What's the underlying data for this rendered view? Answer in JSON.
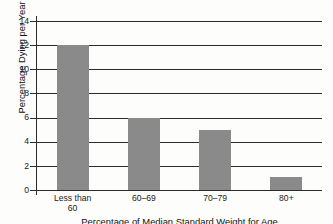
{
  "chart_data": {
    "type": "bar",
    "title": "",
    "xlabel": "Percentage of Median Standard Weight for Age",
    "ylabel": "Percentage Dying per Year",
    "categories": [
      "Less than 60",
      "60–69",
      "70–79",
      "80+"
    ],
    "category_lines": [
      [
        "Less than",
        "60"
      ],
      [
        "60–69"
      ],
      [
        "70–79"
      ],
      [
        "80+"
      ]
    ],
    "values": [
      12,
      6,
      5,
      1.1
    ],
    "ylim": [
      0,
      14
    ],
    "yticks": [
      0,
      2,
      4,
      6,
      8,
      10,
      12,
      14
    ],
    "ytick_labels": [
      "0",
      "2",
      "4",
      "6",
      "8",
      "10",
      "12",
      "14"
    ],
    "grid": "horizontal",
    "legend": "none",
    "series": [
      {
        "name": "Percentage Dying per Year",
        "values": [
          12,
          6,
          5,
          1.1
        ]
      }
    ],
    "colors": {
      "bar_fill": "#8a8a8a",
      "axis": "#2b2b2b",
      "gridline": "#2b2b2b",
      "text": "#1a1a1a",
      "background": "#fdfdfb"
    }
  }
}
